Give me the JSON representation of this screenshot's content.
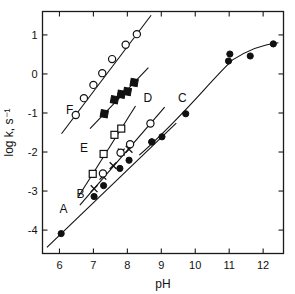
{
  "figure": {
    "background_color": "#ffffff",
    "ink_color": "#111111"
  },
  "chart_data": {
    "type": "scatter",
    "title": "",
    "subtitle": "",
    "xlabel": "pH",
    "ylabel": "log k, s⁻¹",
    "xlim": [
      5.5,
      12.6
    ],
    "ylim": [
      -4.6,
      1.6
    ],
    "xticks": [
      6,
      7,
      8,
      9,
      10,
      11,
      12
    ],
    "xticklabels": [
      "6",
      "7",
      "8",
      "9",
      "10",
      "11",
      "12"
    ],
    "yticks": [
      1,
      0,
      -1,
      -2,
      -3,
      -4
    ],
    "yticklabels": [
      "1",
      "0",
      "-1",
      "-2",
      "-3",
      "-4"
    ],
    "grid": false,
    "legend_position": "inline-annotations",
    "frame": "box",
    "series": [
      {
        "name": "A",
        "label": "A",
        "marker": "filled-circle",
        "line": true,
        "label_position": {
          "x": 6.12,
          "y": -3.55
        },
        "points": [
          {
            "x": 6.05,
            "y": -4.09
          },
          {
            "x": 7.02,
            "y": -3.14
          },
          {
            "x": 7.3,
            "y": -2.86
          },
          {
            "x": 7.78,
            "y": -2.42
          },
          {
            "x": 8.05,
            "y": -2.21
          },
          {
            "x": 8.72,
            "y": -1.74
          },
          {
            "x": 9.02,
            "y": -1.61
          }
        ]
      },
      {
        "name": "B",
        "label": "B",
        "marker": "cross",
        "secondary_marker": "open-circle",
        "line": true,
        "label_position": {
          "x": 6.62,
          "y": -3.17
        },
        "points": [
          {
            "x": 7.02,
            "y": -2.94
          },
          {
            "x": 7.28,
            "y": -2.62
          },
          {
            "x": 7.58,
            "y": -2.35
          },
          {
            "x": 7.82,
            "y": -2.0
          },
          {
            "x": 8.05,
            "y": -1.93
          }
        ],
        "circle_points": [
          {
            "x": 7.28,
            "y": -2.55
          },
          {
            "x": 7.8,
            "y": -2.02
          },
          {
            "x": 8.08,
            "y": -1.8
          },
          {
            "x": 8.68,
            "y": -1.27
          }
        ]
      },
      {
        "name": "C",
        "label": "C",
        "marker": "filled-circle",
        "line": true,
        "line_shape": "sigmoid",
        "label_position": {
          "x": 9.62,
          "y": -0.72
        },
        "points": [
          {
            "x": 8.72,
            "y": -1.74
          },
          {
            "x": 9.72,
            "y": -1.02
          },
          {
            "x": 10.98,
            "y": 0.33
          },
          {
            "x": 11.02,
            "y": 0.51
          },
          {
            "x": 11.62,
            "y": 0.46
          },
          {
            "x": 12.3,
            "y": 0.77
          }
        ]
      },
      {
        "name": "D",
        "label": "D",
        "marker": "open-square",
        "line": true,
        "label_position": {
          "x": 8.6,
          "y": -0.72
        },
        "points": [
          {
            "x": 6.98,
            "y": -2.56
          },
          {
            "x": 7.3,
            "y": -2.05
          },
          {
            "x": 7.62,
            "y": -1.56
          },
          {
            "x": 7.82,
            "y": -1.4
          }
        ]
      },
      {
        "name": "E",
        "label": "E",
        "marker": "filled-square",
        "line": true,
        "label_position": {
          "x": 6.72,
          "y": -2.0
        },
        "points": [
          {
            "x": 7.32,
            "y": -1.02
          },
          {
            "x": 7.62,
            "y": -0.66
          },
          {
            "x": 7.82,
            "y": -0.52
          },
          {
            "x": 8.0,
            "y": -0.45
          },
          {
            "x": 8.2,
            "y": -0.22
          }
        ]
      },
      {
        "name": "F",
        "label": "F",
        "marker": "open-circle",
        "line": true,
        "label_position": {
          "x": 6.3,
          "y": -1.03
        },
        "points": [
          {
            "x": 6.48,
            "y": -1.05
          },
          {
            "x": 6.72,
            "y": -0.62
          },
          {
            "x": 7.0,
            "y": -0.28
          },
          {
            "x": 7.26,
            "y": 0.02
          },
          {
            "x": 7.55,
            "y": 0.38
          },
          {
            "x": 7.95,
            "y": 0.75
          },
          {
            "x": 8.28,
            "y": 1.02
          }
        ]
      }
    ]
  }
}
